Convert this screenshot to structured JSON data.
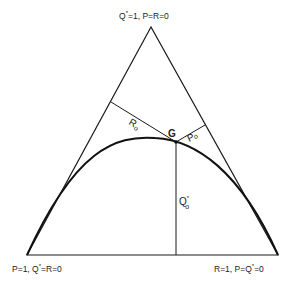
{
  "diagram": {
    "type": "ternary-simplex",
    "colors": {
      "line": "#1a1a1a",
      "curve": "#111111",
      "background": "#ffffff"
    },
    "vertices": {
      "top": {
        "label_main": "Q",
        "label_sup": "*",
        "label_rest": "=1, P=R=0"
      },
      "bottom_left": {
        "label_pre": "P=1, Q",
        "label_sup": "*",
        "label_rest": "=R=0"
      },
      "bottom_right": {
        "label_pre": "R=1, P=Q",
        "label_sup": "*",
        "label_rest": "=0"
      }
    },
    "point": {
      "label": "G"
    },
    "segments": {
      "r0": {
        "main": "R",
        "sub": "o"
      },
      "p0": {
        "main": "P",
        "sub": "o"
      },
      "q0": {
        "main": "Q",
        "sup": "*",
        "sub": "o"
      }
    }
  }
}
